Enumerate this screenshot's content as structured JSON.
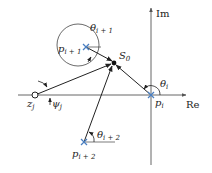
{
  "diagram": {
    "type": "complex-plane root locus angle diagram",
    "axes": {
      "real_label": "Re",
      "imag_label": "Im"
    },
    "points": {
      "s0": {
        "base": "S",
        "sub": "0"
      },
      "p_i": {
        "base": "p",
        "sub": "i"
      },
      "p_i1": {
        "base": "p",
        "sub": "i + 1"
      },
      "p_i2": {
        "base": "p",
        "sub": "i + 2"
      },
      "z_j": {
        "base": "z",
        "sub": "j"
      }
    },
    "angles": {
      "theta_i": {
        "base": "θ",
        "sub": "i"
      },
      "theta_i1": {
        "base": "θ",
        "sub": "i + 1"
      },
      "theta_i2": {
        "base": "θ",
        "sub": "i + 2"
      },
      "psi_j": {
        "base": "ψ",
        "sub": "j"
      }
    },
    "colors": {
      "line": "#222222",
      "axis": "#555555",
      "pole_marker": "#4a7fc1"
    }
  }
}
